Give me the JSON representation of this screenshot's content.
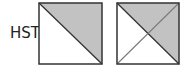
{
  "label": "HST",
  "colors": {
    "shade": "#c2c2c2",
    "line": "#333333",
    "background": "#ffffff",
    "diagonal_light": "#7a7a7a"
  },
  "squares": [
    {
      "name": "half-square-triangle",
      "shaded_regions": [
        "upper-right"
      ],
      "diagonals": [
        "top-left-to-bottom-right"
      ]
    },
    {
      "name": "quarter-square-triangle",
      "shaded_regions": [
        "top",
        "right"
      ],
      "diagonals": [
        "top-left-to-bottom-right",
        "bottom-left-to-top-right"
      ]
    }
  ]
}
